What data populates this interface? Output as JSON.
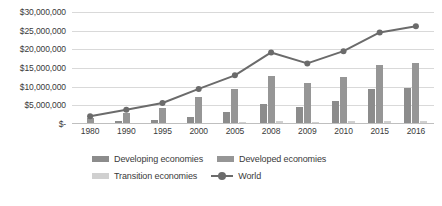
{
  "chart_data": {
    "type": "bar",
    "title": "",
    "xlabel": "",
    "ylabel": "",
    "grid": true,
    "legend_position": "bottom",
    "categories": [
      "1980",
      "1990",
      "1995",
      "2000",
      "2005",
      "2008",
      "2009",
      "2010",
      "2015",
      "2016"
    ],
    "ylim": [
      0,
      30000000
    ],
    "yticks": [
      0,
      5000000,
      10000000,
      15000000,
      20000000,
      25000000,
      30000000
    ],
    "ytick_labels": [
      "$-",
      "$5,000,000",
      "$10,000,000",
      "$15,000,000",
      "$20,000,000",
      "$25,000,000",
      "$30,000,000"
    ],
    "series": [
      {
        "name": "Developing economies",
        "type": "bar",
        "color": "#8c8c8c",
        "values": [
          400000,
          800000,
          1200000,
          2000000,
          3300000,
          5400000,
          4500000,
          6100000,
          9400000,
          9600000
        ]
      },
      {
        "name": "Developed economies",
        "type": "bar",
        "color": "#969696",
        "values": [
          1600000,
          2900000,
          4300000,
          7200000,
          9300000,
          12900000,
          11100000,
          12600000,
          15900000,
          16400000
        ]
      },
      {
        "name": "Transition economies",
        "type": "bar",
        "color": "#d0d0d0",
        "values": [
          60000,
          100000,
          110000,
          200000,
          440000,
          870000,
          630000,
          810000,
          730000,
          680000
        ]
      },
      {
        "name": "World",
        "type": "line",
        "color": "#6b6b6b",
        "marker": "circle",
        "values": [
          2060000,
          3800000,
          5610000,
          9400000,
          13040000,
          19170000,
          16230000,
          19510000,
          24530000,
          26180000
        ]
      }
    ]
  },
  "legend": {
    "items": [
      {
        "label": "Developing economies",
        "swatch": "developing"
      },
      {
        "label": "Developed economies",
        "swatch": "developed"
      },
      {
        "label": "Transition economies",
        "swatch": "transition"
      },
      {
        "label": "World",
        "swatch": "world"
      }
    ]
  }
}
